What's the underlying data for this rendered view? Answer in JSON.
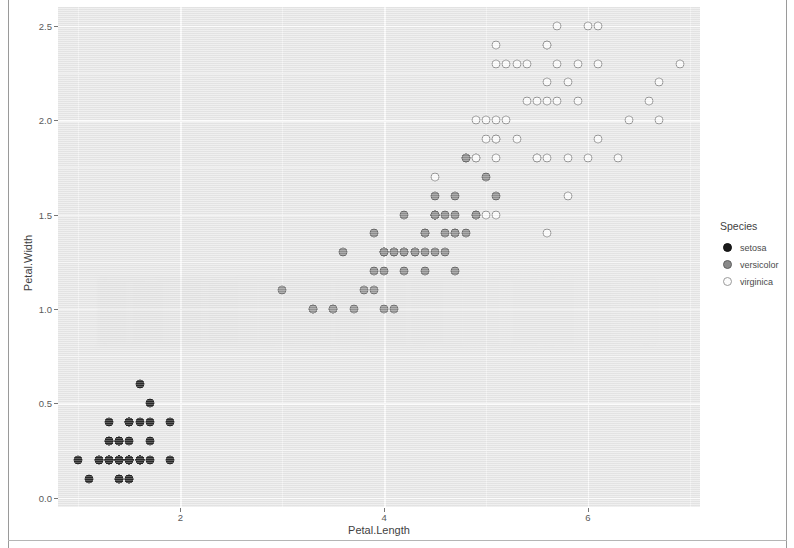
{
  "chart_data": {
    "type": "scatter",
    "title": "",
    "xlabel": "Petal.Length",
    "ylabel": "Petal.Width",
    "xlim": [
      0.8,
      7.1
    ],
    "ylim": [
      -0.05,
      2.6
    ],
    "xticks": [
      2,
      4,
      6
    ],
    "xtick_labels": [
      "2",
      "4",
      "6"
    ],
    "yticks": [
      0.0,
      0.5,
      1.0,
      1.5,
      2.0,
      2.5
    ],
    "ytick_labels": [
      "0.0",
      "0.5",
      "1.0",
      "1.5",
      "2.0",
      "2.5"
    ],
    "x_minor_ticks": [
      1,
      3,
      5,
      7
    ],
    "y_minor_ticks": [
      0.25,
      0.75,
      1.25,
      1.75,
      2.25
    ],
    "grid": true,
    "panel_background": "#e9e9e9",
    "gridline_color": "#fbfbfb",
    "legend": {
      "title": "Species",
      "position": "right",
      "entries": [
        {
          "label": "setosa",
          "color": "#1a1a1a",
          "fill": "solid-black"
        },
        {
          "label": "versicolor",
          "color": "#8a8a8a",
          "fill": "solid-gray"
        },
        {
          "label": "virginica",
          "color": "#fcfcfc",
          "fill": "open-white"
        }
      ]
    },
    "series": [
      {
        "name": "setosa",
        "color": "#1a1a1a",
        "points": [
          [
            1.4,
            0.2
          ],
          [
            1.4,
            0.2
          ],
          [
            1.3,
            0.2
          ],
          [
            1.5,
            0.2
          ],
          [
            1.4,
            0.2
          ],
          [
            1.7,
            0.4
          ],
          [
            1.4,
            0.3
          ],
          [
            1.5,
            0.2
          ],
          [
            1.4,
            0.2
          ],
          [
            1.5,
            0.1
          ],
          [
            1.5,
            0.2
          ],
          [
            1.6,
            0.2
          ],
          [
            1.4,
            0.1
          ],
          [
            1.1,
            0.1
          ],
          [
            1.2,
            0.2
          ],
          [
            1.5,
            0.4
          ],
          [
            1.3,
            0.4
          ],
          [
            1.4,
            0.3
          ],
          [
            1.7,
            0.3
          ],
          [
            1.5,
            0.3
          ],
          [
            1.7,
            0.2
          ],
          [
            1.5,
            0.4
          ],
          [
            1.0,
            0.2
          ],
          [
            1.7,
            0.5
          ],
          [
            1.9,
            0.2
          ],
          [
            1.6,
            0.2
          ],
          [
            1.6,
            0.4
          ],
          [
            1.5,
            0.2
          ],
          [
            1.4,
            0.2
          ],
          [
            1.6,
            0.2
          ],
          [
            1.6,
            0.2
          ],
          [
            1.5,
            0.4
          ],
          [
            1.5,
            0.1
          ],
          [
            1.4,
            0.2
          ],
          [
            1.5,
            0.2
          ],
          [
            1.2,
            0.2
          ],
          [
            1.3,
            0.2
          ],
          [
            1.4,
            0.1
          ],
          [
            1.3,
            0.2
          ],
          [
            1.5,
            0.2
          ],
          [
            1.3,
            0.3
          ],
          [
            1.3,
            0.3
          ],
          [
            1.3,
            0.2
          ],
          [
            1.6,
            0.6
          ],
          [
            1.9,
            0.4
          ],
          [
            1.4,
            0.3
          ],
          [
            1.6,
            0.2
          ],
          [
            1.4,
            0.2
          ],
          [
            1.5,
            0.2
          ],
          [
            1.4,
            0.2
          ]
        ]
      },
      {
        "name": "versicolor",
        "color": "#8a8a8a",
        "points": [
          [
            4.7,
            1.4
          ],
          [
            4.5,
            1.5
          ],
          [
            4.9,
            1.5
          ],
          [
            4.0,
            1.3
          ],
          [
            4.6,
            1.5
          ],
          [
            4.5,
            1.3
          ],
          [
            4.7,
            1.6
          ],
          [
            3.3,
            1.0
          ],
          [
            4.6,
            1.3
          ],
          [
            3.9,
            1.4
          ],
          [
            3.5,
            1.0
          ],
          [
            4.2,
            1.5
          ],
          [
            4.0,
            1.0
          ],
          [
            4.7,
            1.4
          ],
          [
            3.6,
            1.3
          ],
          [
            4.4,
            1.4
          ],
          [
            4.5,
            1.5
          ],
          [
            4.1,
            1.0
          ],
          [
            4.5,
            1.5
          ],
          [
            3.9,
            1.1
          ],
          [
            4.8,
            1.8
          ],
          [
            4.0,
            1.3
          ],
          [
            4.9,
            1.5
          ],
          [
            4.7,
            1.2
          ],
          [
            4.3,
            1.3
          ],
          [
            4.4,
            1.4
          ],
          [
            4.8,
            1.4
          ],
          [
            5.0,
            1.7
          ],
          [
            4.5,
            1.5
          ],
          [
            3.5,
            1.0
          ],
          [
            3.8,
            1.1
          ],
          [
            3.7,
            1.0
          ],
          [
            3.9,
            1.2
          ],
          [
            5.1,
            1.6
          ],
          [
            4.5,
            1.5
          ],
          [
            4.5,
            1.6
          ],
          [
            4.7,
            1.5
          ],
          [
            4.4,
            1.3
          ],
          [
            4.1,
            1.3
          ],
          [
            4.0,
            1.3
          ],
          [
            4.4,
            1.2
          ],
          [
            4.6,
            1.4
          ],
          [
            4.0,
            1.2
          ],
          [
            3.3,
            1.0
          ],
          [
            4.2,
            1.3
          ],
          [
            4.2,
            1.2
          ],
          [
            4.2,
            1.3
          ],
          [
            4.3,
            1.3
          ],
          [
            3.0,
            1.1
          ],
          [
            4.1,
            1.3
          ]
        ]
      },
      {
        "name": "virginica",
        "color": "#fcfcfc",
        "points": [
          [
            6.0,
            2.5
          ],
          [
            5.1,
            1.9
          ],
          [
            5.9,
            2.1
          ],
          [
            5.6,
            1.8
          ],
          [
            5.8,
            2.2
          ],
          [
            6.6,
            2.1
          ],
          [
            4.5,
            1.7
          ],
          [
            6.3,
            1.8
          ],
          [
            5.8,
            1.8
          ],
          [
            6.1,
            2.5
          ],
          [
            5.1,
            2.0
          ],
          [
            5.3,
            1.9
          ],
          [
            5.5,
            2.1
          ],
          [
            5.0,
            2.0
          ],
          [
            5.1,
            2.4
          ],
          [
            5.3,
            2.3
          ],
          [
            5.5,
            1.8
          ],
          [
            6.7,
            2.2
          ],
          [
            6.9,
            2.3
          ],
          [
            5.0,
            1.5
          ],
          [
            5.7,
            2.3
          ],
          [
            4.9,
            2.0
          ],
          [
            6.7,
            2.0
          ],
          [
            4.9,
            1.8
          ],
          [
            5.7,
            2.1
          ],
          [
            6.0,
            1.8
          ],
          [
            4.8,
            1.8
          ],
          [
            4.9,
            1.8
          ],
          [
            5.6,
            2.1
          ],
          [
            5.8,
            1.6
          ],
          [
            6.1,
            1.9
          ],
          [
            6.4,
            2.0
          ],
          [
            5.6,
            2.2
          ],
          [
            5.1,
            1.5
          ],
          [
            5.6,
            1.4
          ],
          [
            6.1,
            2.3
          ],
          [
            5.6,
            2.4
          ],
          [
            5.5,
            1.8
          ],
          [
            4.8,
            1.8
          ],
          [
            5.4,
            2.1
          ],
          [
            5.6,
            2.4
          ],
          [
            5.1,
            2.3
          ],
          [
            5.1,
            1.9
          ],
          [
            5.9,
            2.3
          ],
          [
            5.7,
            2.5
          ],
          [
            5.2,
            2.3
          ],
          [
            5.0,
            1.9
          ],
          [
            5.2,
            2.0
          ],
          [
            5.4,
            2.3
          ],
          [
            5.1,
            1.8
          ]
        ]
      }
    ]
  }
}
